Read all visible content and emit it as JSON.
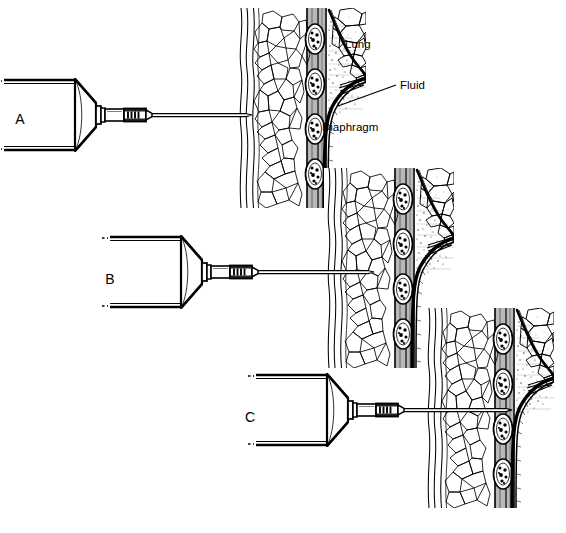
{
  "figure": {
    "style": "black-and-white line drawing",
    "background_color": "#ffffff",
    "ink_color": "#000000",
    "width": 566,
    "height": 533
  },
  "panels": [
    {
      "id": "A",
      "letter": "A",
      "letter_x": 20,
      "letter_y": 124,
      "description": "Syringe with needle held against the skin surface, not yet inserted",
      "syringe": {
        "cone_tip_x": 100,
        "cone_tip_y": 115,
        "hub_x": 118,
        "needle_tip_x": 250,
        "needle_y": 115,
        "needle_angle_deg": 0
      },
      "anatomy_x": 236,
      "anatomy_y": 8,
      "anatomy_w": 130,
      "anatomy_h": 200
    },
    {
      "id": "B",
      "letter": "B",
      "letter_x": 110,
      "letter_y": 284,
      "description": "Needle advanced through the chest wall just above the rib",
      "syringe": {
        "cone_tip_x": 206,
        "cone_tip_y": 272,
        "hub_x": 224,
        "needle_tip_x": 372,
        "needle_y": 272,
        "needle_angle_deg": 0
      },
      "anatomy_x": 324,
      "anatomy_y": 168,
      "anatomy_w": 130,
      "anatomy_h": 200
    },
    {
      "id": "C",
      "letter": "C",
      "letter_x": 250,
      "letter_y": 422,
      "description": "Needle advanced deeply into the pleural fluid collection",
      "syringe": {
        "cone_tip_x": 352,
        "cone_tip_y": 410,
        "hub_x": 370,
        "needle_tip_x": 510,
        "needle_y": 410,
        "needle_angle_deg": 0
      },
      "anatomy_x": 424,
      "anatomy_y": 308,
      "anatomy_w": 130,
      "anatomy_h": 200
    }
  ],
  "annotations": [
    {
      "id": "lung",
      "label": "Lung",
      "x": 345,
      "y": 48,
      "has_leader_line": false,
      "target": "lung parenchyma"
    },
    {
      "id": "fluid",
      "label": "Fluid",
      "x": 400,
      "y": 86,
      "has_leader_line": true,
      "leader_from_x": 396,
      "leader_from_y": 85,
      "leader_to_x": 338,
      "leader_to_y": 106,
      "target": "pleural fluid in costophrenic recess"
    },
    {
      "id": "diaphragm",
      "label": "Diaphragm",
      "x": 322,
      "y": 131,
      "has_leader_line": false,
      "target": "diaphragm dome"
    }
  ],
  "anatomy_legend": {
    "skin": "outer wavy skin lines",
    "subcutaneous": "cellular fat/muscle pattern",
    "ribs": "stacked oval rib cross-sections with marrow",
    "pleural_space": "stippled fluid region",
    "lung": "polygonal alveolar pattern",
    "diaphragm": "thick curved band"
  }
}
